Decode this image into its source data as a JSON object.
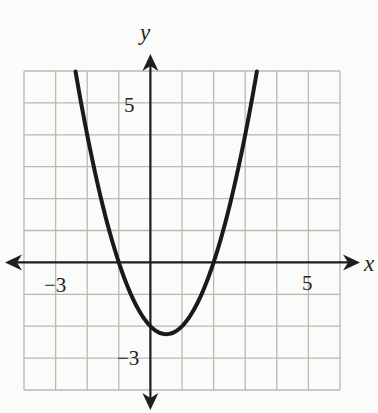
{
  "chart_data": {
    "type": "line",
    "title": "",
    "xlabel": "x",
    "ylabel": "y",
    "xlim": [
      -4,
      6
    ],
    "ylim": [
      -4,
      6
    ],
    "grid": true,
    "grid_step": 1,
    "tick_labels": {
      "x": [
        {
          "value": -3,
          "label": "−3"
        },
        {
          "value": 5,
          "label": "5"
        }
      ],
      "y": [
        {
          "value": 5,
          "label": "5"
        },
        {
          "value": -3,
          "label": "−3"
        }
      ]
    },
    "series": [
      {
        "name": "parabola",
        "equation": "y = x^2 - x - 2",
        "vertex": [
          0.5,
          -2.25
        ],
        "roots": [
          -1,
          2
        ],
        "y_intercept": -2,
        "x": [
          -2.37,
          -2,
          -1.5,
          -1,
          -0.5,
          0,
          0.5,
          1,
          1.5,
          2,
          2.5,
          3,
          3.37
        ],
        "y": [
          6.0,
          4.0,
          1.75,
          0,
          -1.25,
          -2,
          -2.25,
          -2,
          -1.25,
          0,
          1.75,
          4.0,
          6.0
        ]
      }
    ],
    "legend": null
  },
  "labels": {
    "x_axis": "x",
    "y_axis": "y",
    "x_neg": "−3",
    "x_pos": "5",
    "y_pos": "5",
    "y_neg": "−3"
  },
  "colors": {
    "grid": "#b8b8b4",
    "axis": "#1e1e1e",
    "curve": "#1a1a1a",
    "background": "#fbfbf9"
  }
}
